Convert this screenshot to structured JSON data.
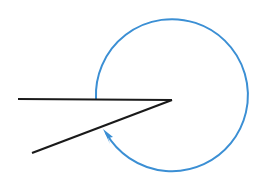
{
  "figure": {
    "width": 266,
    "height": 187,
    "background_color": "#ffffff"
  },
  "colors": {
    "ray": "#1a1a1a",
    "arc": "#3b8fd4",
    "arrow": "#3b8fd4",
    "background": "#ffffff"
  },
  "strokes": {
    "ray_width": 2.2,
    "arc_width": 2.0
  },
  "vertex": {
    "label": "angle-vertex",
    "x": 172,
    "y": 100
  },
  "rays": [
    {
      "name": "horizontal-ray",
      "from_x": 172,
      "from_y": 100,
      "to_x": 18,
      "to_y": 99,
      "direction_degrees": 180
    },
    {
      "name": "lower-ray",
      "from_x": 172,
      "from_y": 100,
      "to_x": 32,
      "to_y": 153,
      "direction_degrees": 200.7
    }
  ],
  "arc": {
    "name": "reflex-angle-arc",
    "center_x": 171,
    "center_y": 102,
    "radius": 76,
    "start_x": 96,
    "start_y": 99,
    "end_x": 106,
    "end_y": 133,
    "sweep_direction": "clockwise",
    "sweep_degrees": 342,
    "large_arc": true,
    "path": "M 96 99 A 76 76 0 1 1 106 133"
  },
  "arrow_head": {
    "name": "arc-arrowhead",
    "tip_x": 103,
    "tip_y": 129,
    "points": "103,129 113,137 108,138 110,144",
    "angle_degrees": 218
  },
  "chart_data": {
    "type": "diagram",
    "measured_angle_degrees": 342,
    "interior_angle_degrees": 18,
    "elements": [
      "horizontal-ray",
      "lower-ray",
      "vertex",
      "reflex-angle-arc",
      "arc-arrowhead"
    ],
    "labels": [],
    "annotations": []
  }
}
